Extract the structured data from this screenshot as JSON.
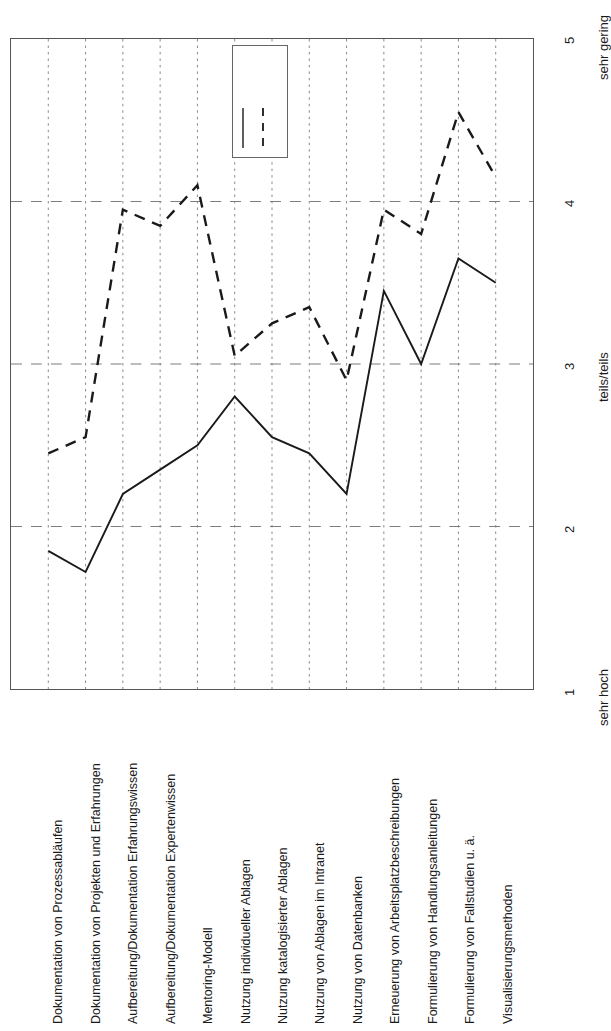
{
  "chart_data": {
    "type": "line",
    "title": "",
    "subtitle": "",
    "xlabel": "",
    "ylabel": "",
    "orientation": "rotated-90",
    "grid": true,
    "grid_style": "dashed",
    "ylim": [
      1,
      5
    ],
    "yticks": [
      1,
      2,
      3,
      4,
      5
    ],
    "ytick_labels": [
      "1",
      "2",
      "3",
      "4",
      "5"
    ],
    "y_anchor_labels": [
      {
        "value": 1,
        "text": "sehr hoch"
      },
      {
        "value": 3,
        "text": "teils/teils"
      },
      {
        "value": 5,
        "text": "sehr gering"
      }
    ],
    "legend": {
      "position": "top-center-inside",
      "entries": [
        {
          "style": "solid",
          "label": ""
        },
        {
          "style": "dashed",
          "label": ""
        }
      ]
    },
    "categories": [
      "Dokumentation von Prozessabläufen",
      "Dokumentation von Projekten und Erfahrungen",
      "Aufbereitung/Dokumentation Erfahrungswissen",
      "Aufbereitung/Dokumentation Expertenwissen",
      "Mentoring-Modell",
      "Nutzung individueller Ablagen",
      "Nutzung katalogisierter Ablagen",
      "Nutzung von Ablagen im Intranet",
      "Nutzung von Datenbanken",
      "Erneuerung von Arbeitsplatzbeschreibungen",
      "Formulierung von Handlungsanleitungen",
      "Formulierung von Fallstudien u. ä.",
      "Visualisierungsmethoden"
    ],
    "series": [
      {
        "name": "solid-series",
        "style": "solid",
        "color": "#1a1a1a",
        "values": [
          1.85,
          1.72,
          2.2,
          2.35,
          2.5,
          2.8,
          2.55,
          2.45,
          2.2,
          3.45,
          3.0,
          3.65,
          3.5
        ]
      },
      {
        "name": "dashed-series",
        "style": "dashed",
        "color": "#1a1a1a",
        "values": [
          2.45,
          2.55,
          3.95,
          3.85,
          4.1,
          3.05,
          3.25,
          3.35,
          2.9,
          3.95,
          3.8,
          4.55,
          4.15
        ]
      }
    ]
  }
}
